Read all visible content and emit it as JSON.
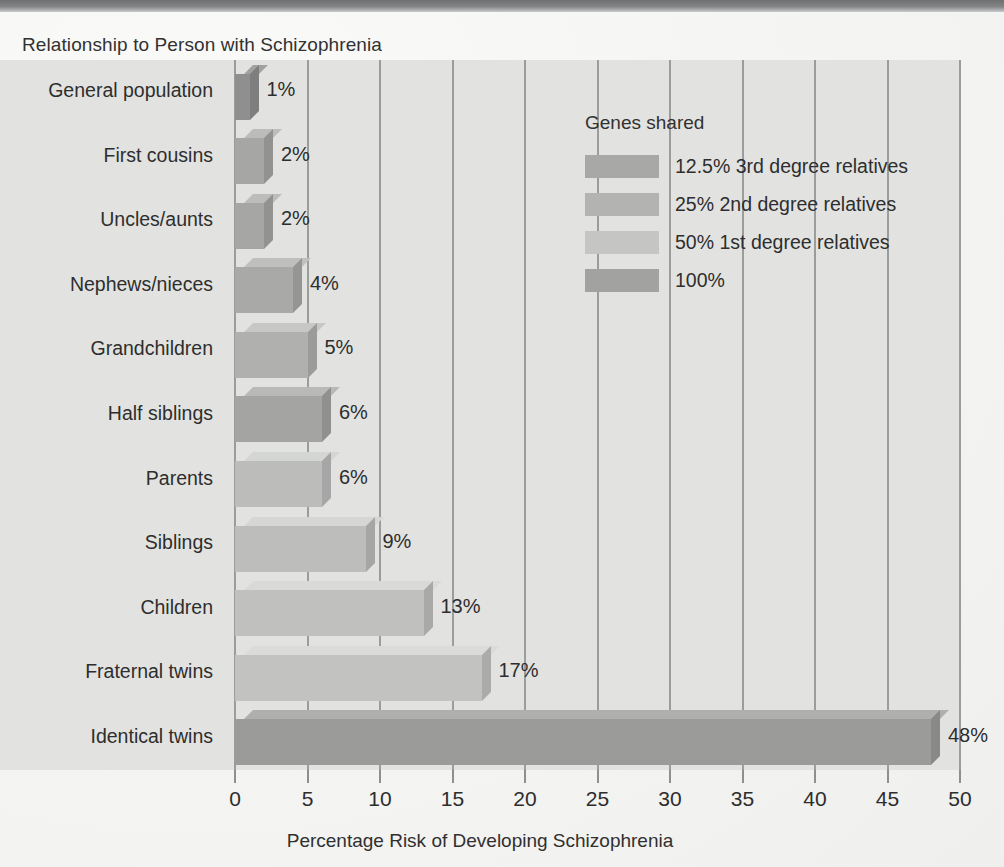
{
  "chart_data": {
    "type": "bar",
    "orientation": "horizontal",
    "title": "",
    "ylabel": "Relationship to Person with Schizophrenia",
    "xlabel": "Percentage Risk of Developing Schizophrenia",
    "xlim": [
      0,
      50
    ],
    "xticks": [
      0,
      5,
      10,
      15,
      20,
      25,
      30,
      35,
      40,
      45,
      50
    ],
    "grid": true,
    "legend_position": "upper-right",
    "categories": [
      "General population",
      "First cousins",
      "Uncles/aunts",
      "Nephews/nieces",
      "Grandchildren",
      "Half siblings",
      "Parents",
      "Siblings",
      "Children",
      "Fraternal twins",
      "Identical twins"
    ],
    "values": [
      1,
      2,
      2,
      4,
      5,
      6,
      6,
      9,
      13,
      17,
      48
    ],
    "value_labels": [
      "1%",
      "2%",
      "2%",
      "4%",
      "5%",
      "6%",
      "6%",
      "9%",
      "13%",
      "17%",
      "48%"
    ],
    "group_by_category": [
      "100%",
      "12.5% 3rd degree relatives",
      "25% 2nd degree relatives",
      "25% 2nd degree relatives",
      "25% 2nd degree relatives",
      "25% 2nd degree relatives",
      "50% 1st degree relatives",
      "50% 1st degree relatives",
      "50% 1st degree relatives",
      "50% 1st degree relatives",
      "100%"
    ],
    "bar_colors": [
      "#8e8f8e",
      "#a6a7a5",
      "#a6a7a5",
      "#a9aaa8",
      "#b0b1af",
      "#a4a5a3",
      "#bcbdbb",
      "#bdbebc",
      "#c0c1bf",
      "#c2c3c1",
      "#9b9c9a"
    ]
  },
  "legend": {
    "title": "Genes shared",
    "items": [
      {
        "label": "12.5% 3rd degree relatives",
        "color": "#a8a9a7"
      },
      {
        "label": "25% 2nd degree relatives",
        "color": "#b3b4b2"
      },
      {
        "label": "50% 1st degree relatives",
        "color": "#c5c6c4"
      },
      {
        "label": "100%",
        "color": "#a2a3a1"
      }
    ]
  },
  "colors": {
    "plot_background": "#e2e3e1",
    "page_background": "#f2f2f0",
    "gridline": "#9b9d9c",
    "text": "#2d2d2d"
  }
}
